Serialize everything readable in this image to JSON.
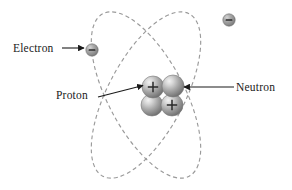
{
  "figure": {
    "kind": "atom-diagram",
    "background_color": "#ffffff",
    "labels": {
      "electron": "Electron",
      "proton": "Proton",
      "neutron": "Neutron"
    },
    "symbols": {
      "positive": "+",
      "negative": "−"
    },
    "colors": {
      "orbit_stroke": "#9a9a9a",
      "sphere_base": "#8e8e8e",
      "sphere_highlight": "#e8e8e8",
      "sphere_shadow": "#5e5e5e",
      "arrow": "#1a1a1a",
      "text": "#1a1a1a"
    },
    "orbits": [
      {
        "name": "orbit-left-tilt",
        "cx": 146,
        "cy": 95,
        "rx": 38,
        "ry": 92,
        "rotation_deg": 28,
        "dash": "4 3"
      },
      {
        "name": "orbit-right-tilt",
        "cx": 146,
        "cy": 95,
        "rx": 38,
        "ry": 92,
        "rotation_deg": -28,
        "dash": "4 3"
      }
    ],
    "electrons": [
      {
        "name": "electron-left",
        "cx": 92,
        "cy": 50,
        "r": 6,
        "charge": "−"
      },
      {
        "name": "electron-upper-right",
        "cx": 229,
        "cy": 20,
        "r": 6,
        "charge": "−"
      }
    ],
    "nucleus": [
      {
        "name": "proton-top-left",
        "cx": 153,
        "cy": 87,
        "r": 11,
        "charge": "+"
      },
      {
        "name": "neutron-top-right",
        "cx": 173,
        "cy": 86,
        "r": 11,
        "charge": ""
      },
      {
        "name": "neutron-bottom-left",
        "cx": 152,
        "cy": 105,
        "r": 11,
        "charge": ""
      },
      {
        "name": "proton-bottom-right",
        "cx": 172,
        "cy": 105,
        "r": 11,
        "charge": "+"
      }
    ],
    "arrows": [
      {
        "name": "arrow-electron",
        "x1": 62,
        "y1": 48,
        "x2": 85,
        "y2": 48
      },
      {
        "name": "arrow-proton",
        "x1": 98,
        "y1": 97,
        "x2": 144,
        "y2": 85
      },
      {
        "name": "arrow-neutron",
        "x1": 233,
        "y1": 87,
        "x2": 182,
        "y2": 87
      }
    ]
  }
}
